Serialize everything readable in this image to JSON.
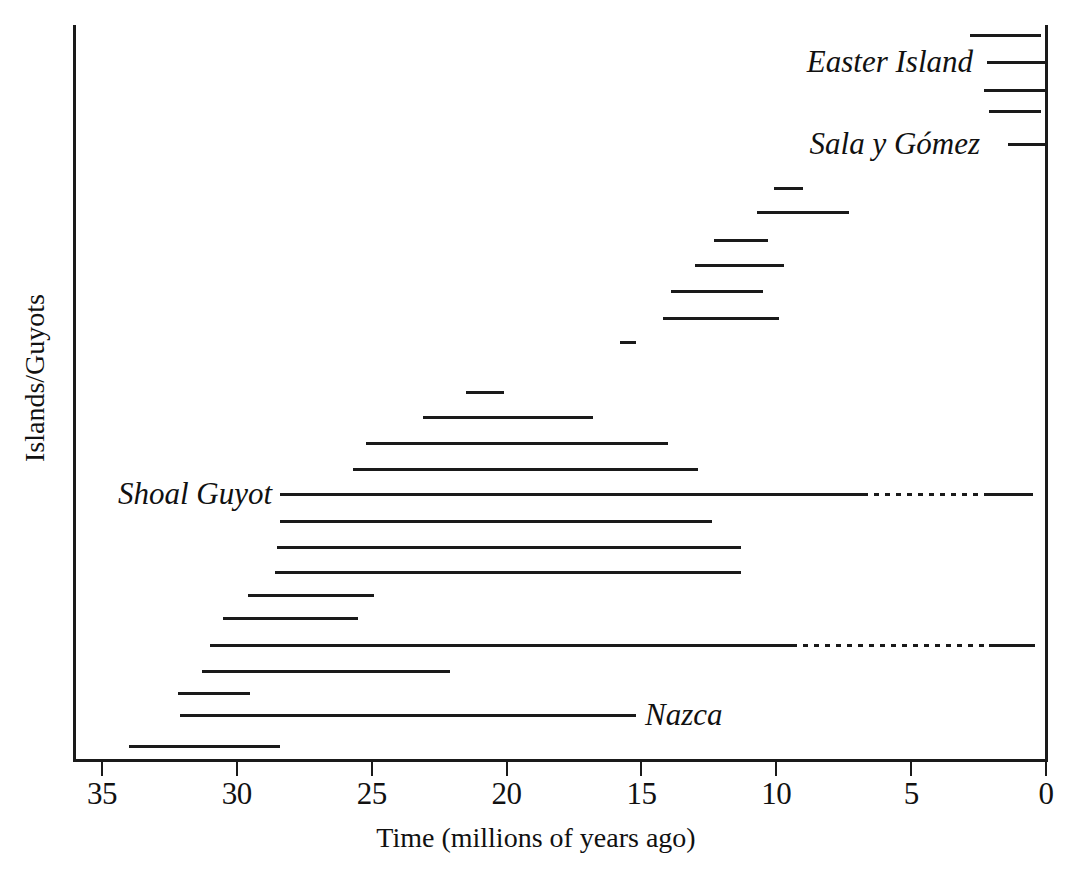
{
  "chart_data": {
    "type": "bar",
    "orientation": "horizontal-ranges",
    "title": "",
    "xlabel": "Time (millions of years ago)",
    "ylabel": "Islands/Guyots",
    "xlim": [
      35,
      0
    ],
    "x_axis_reversed": true,
    "xticks": [
      35,
      30,
      25,
      20,
      15,
      10,
      5,
      0
    ],
    "xtick_labels": [
      "35",
      "30",
      "25",
      "20",
      "15",
      "10",
      "5",
      "0"
    ],
    "grid": false,
    "legend": null,
    "units": "millions of years ago",
    "series_note": "Each horizontal bar is the age range of one island or guyot on the Nazca / Salas y Gomez hotspot track. Dotted segments denote inferred or uncertain age continuation.",
    "bars": [
      {
        "id": "bar-01",
        "row": 1,
        "start_ma": 2.8,
        "end_ma": 0.2,
        "dotted_start_ma": null,
        "dotted_end_ma": null,
        "label": ""
      },
      {
        "id": "bar-02",
        "row": 2,
        "start_ma": 2.2,
        "end_ma": 0.0,
        "dotted_start_ma": null,
        "dotted_end_ma": null,
        "label": "Easter Island"
      },
      {
        "id": "bar-03",
        "row": 3,
        "start_ma": 2.3,
        "end_ma": 0.0,
        "dotted_start_ma": null,
        "dotted_end_ma": null,
        "label": ""
      },
      {
        "id": "bar-04",
        "row": 4,
        "start_ma": 2.1,
        "end_ma": 0.2,
        "dotted_start_ma": null,
        "dotted_end_ma": null,
        "label": ""
      },
      {
        "id": "bar-05",
        "row": 5,
        "start_ma": 1.4,
        "end_ma": 0.0,
        "dotted_start_ma": null,
        "dotted_end_ma": null,
        "label": "Sala y Gómez"
      },
      {
        "id": "bar-06",
        "row": 6,
        "start_ma": 10.1,
        "end_ma": 9.0,
        "dotted_start_ma": null,
        "dotted_end_ma": null,
        "label": ""
      },
      {
        "id": "bar-07",
        "row": 7,
        "start_ma": 10.7,
        "end_ma": 7.3,
        "dotted_start_ma": null,
        "dotted_end_ma": null,
        "label": ""
      },
      {
        "id": "bar-08",
        "row": 8,
        "start_ma": 12.3,
        "end_ma": 10.3,
        "dotted_start_ma": null,
        "dotted_end_ma": null,
        "label": ""
      },
      {
        "id": "bar-09",
        "row": 9,
        "start_ma": 13.0,
        "end_ma": 9.7,
        "dotted_start_ma": null,
        "dotted_end_ma": null,
        "label": ""
      },
      {
        "id": "bar-10",
        "row": 10,
        "start_ma": 13.9,
        "end_ma": 10.5,
        "dotted_start_ma": null,
        "dotted_end_ma": null,
        "label": ""
      },
      {
        "id": "bar-11",
        "row": 11,
        "start_ma": 14.2,
        "end_ma": 9.9,
        "dotted_start_ma": null,
        "dotted_end_ma": null,
        "label": ""
      },
      {
        "id": "bar-12",
        "row": 12,
        "start_ma": 15.8,
        "end_ma": 15.2,
        "dotted_start_ma": null,
        "dotted_end_ma": null,
        "label": ""
      },
      {
        "id": "bar-13",
        "row": 13,
        "start_ma": 21.5,
        "end_ma": 20.1,
        "dotted_start_ma": null,
        "dotted_end_ma": null,
        "label": ""
      },
      {
        "id": "bar-14",
        "row": 14,
        "start_ma": 23.1,
        "end_ma": 16.8,
        "dotted_start_ma": null,
        "dotted_end_ma": null,
        "label": ""
      },
      {
        "id": "bar-15",
        "row": 15,
        "start_ma": 25.2,
        "end_ma": 14.0,
        "dotted_start_ma": null,
        "dotted_end_ma": null,
        "label": ""
      },
      {
        "id": "bar-16",
        "row": 16,
        "start_ma": 25.7,
        "end_ma": 12.9,
        "dotted_start_ma": null,
        "dotted_end_ma": null,
        "label": ""
      },
      {
        "id": "bar-17",
        "row": 17,
        "start_ma": 28.4,
        "end_ma": 0.5,
        "dotted_start_ma": 6.8,
        "dotted_end_ma": 2.3,
        "label": "Shoal Guyot"
      },
      {
        "id": "bar-18",
        "row": 18,
        "start_ma": 28.4,
        "end_ma": 12.4,
        "dotted_start_ma": null,
        "dotted_end_ma": null,
        "label": ""
      },
      {
        "id": "bar-19",
        "row": 19,
        "start_ma": 28.5,
        "end_ma": 11.3,
        "dotted_start_ma": null,
        "dotted_end_ma": null,
        "label": ""
      },
      {
        "id": "bar-20",
        "row": 20,
        "start_ma": 28.6,
        "end_ma": 11.3,
        "dotted_start_ma": null,
        "dotted_end_ma": null,
        "label": ""
      },
      {
        "id": "bar-21",
        "row": 21,
        "start_ma": 29.6,
        "end_ma": 24.9,
        "dotted_start_ma": null,
        "dotted_end_ma": null,
        "label": ""
      },
      {
        "id": "bar-22",
        "row": 22,
        "start_ma": 30.5,
        "end_ma": 25.5,
        "dotted_start_ma": null,
        "dotted_end_ma": null,
        "label": ""
      },
      {
        "id": "bar-23",
        "row": 23,
        "start_ma": 31.0,
        "end_ma": 0.4,
        "dotted_start_ma": 9.4,
        "dotted_end_ma": 2.1,
        "label": ""
      },
      {
        "id": "bar-24",
        "row": 24,
        "start_ma": 31.3,
        "end_ma": 22.1,
        "dotted_start_ma": null,
        "dotted_end_ma": null,
        "label": ""
      },
      {
        "id": "bar-25",
        "row": 25,
        "start_ma": 32.2,
        "end_ma": 29.5,
        "dotted_start_ma": null,
        "dotted_end_ma": null,
        "label": ""
      },
      {
        "id": "bar-26",
        "row": 26,
        "start_ma": 32.1,
        "end_ma": 15.2,
        "dotted_start_ma": null,
        "dotted_end_ma": null,
        "label": "Nazca"
      },
      {
        "id": "bar-27",
        "row": 27,
        "start_ma": 34.0,
        "end_ma": 28.4,
        "dotted_start_ma": null,
        "dotted_end_ma": null,
        "label": ""
      }
    ],
    "annotations": [
      {
        "text": "Easter Island",
        "anchor_bar": "bar-02",
        "side": "left"
      },
      {
        "text": "Sala y Gómez",
        "anchor_bar": "bar-05",
        "side": "left"
      },
      {
        "text": "Shoal Guyot",
        "anchor_bar": "bar-17",
        "side": "left"
      },
      {
        "text": "Nazca",
        "anchor_bar": "bar-26",
        "side": "right"
      }
    ]
  },
  "colors": {
    "ink": "#1a1a1a",
    "background": "#ffffff"
  }
}
